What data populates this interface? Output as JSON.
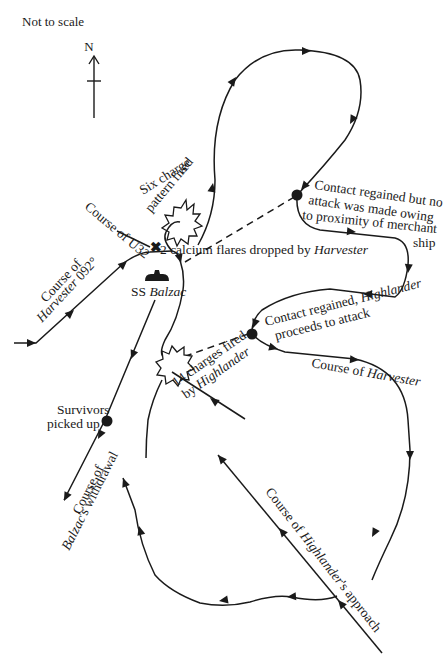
{
  "diagram": {
    "scale_note": "Not to scale",
    "compass": {
      "label": "N"
    },
    "labels": {
      "six_charge_line1": "Six charge",
      "six_charge_line2": "pattern fired",
      "course_u32": "Course of U32",
      "flares_prefix": "2 calcium flares dropped by ",
      "flares_ship": "Harvester",
      "contact_no_attack_1": "Contact regained but no",
      "contact_no_attack_2": "attack was made owing",
      "contact_no_attack_3": "to proximity of merchant",
      "contact_no_attack_4": "ship",
      "course_harvester_092_1": "Course of",
      "course_harvester_092_2_ship": "Harvester",
      "course_harvester_092_2_rest": " 092°",
      "ss_prefix": "SS ",
      "ss_name": "Balzac",
      "contact_attack_1_prefix": "Contact regained, ",
      "contact_attack_1_ship": "Highlander",
      "contact_attack_2": "proceeds to attack",
      "charges_14_line1": "14 charges fired",
      "charges_14_line2_prefix": "by ",
      "charges_14_line2_ship": "Highlander",
      "course_harvester_prefix": "Course of ",
      "course_harvester_ship": "Harvester",
      "survivors_1": "Survivors",
      "survivors_2": "picked up",
      "withdrawal_1": "Course of",
      "withdrawal_2_ship": "Balzac",
      "withdrawal_2_rest": "'s withdrawal",
      "approach_prefix": "Course of ",
      "approach_ship": "Highlander",
      "approach_rest": "'s approach"
    },
    "events": [
      {
        "name": "Six charge pattern fired",
        "type": "depth-charge-burst"
      },
      {
        "name": "2 calcium flares dropped by Harvester",
        "type": "cross-marker"
      },
      {
        "name": "Contact regained but no attack",
        "type": "contact-point"
      },
      {
        "name": "Contact regained, Highlander proceeds to attack",
        "type": "contact-point"
      },
      {
        "name": "14 charges fired by Highlander",
        "type": "depth-charge-burst"
      },
      {
        "name": "Survivors picked up",
        "type": "contact-point"
      },
      {
        "name": "SS Balzac",
        "type": "ship"
      }
    ]
  }
}
